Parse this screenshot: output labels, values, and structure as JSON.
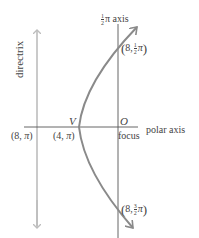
{
  "diagram": {
    "type": "polar parabola",
    "colors": {
      "axis_line": "#555555",
      "directrix_line": "#bdbdbd",
      "curve": "#8a8a8a",
      "text": "#444444",
      "background": "#ffffff"
    },
    "labels": {
      "directrix": "directrix",
      "half_pi_axis_frac_num": "1",
      "half_pi_axis_frac_den": "2",
      "half_pi_axis_suffix": "π axis",
      "polar_axis": "polar axis",
      "vertex": "V",
      "origin": "O",
      "focus": "focus"
    },
    "points": [
      {
        "id": "p8pi",
        "r": "8",
        "theta": "π",
        "text": "(8, π)"
      },
      {
        "id": "p4pi",
        "r": "4",
        "theta": "π",
        "text": "(4, π)"
      },
      {
        "id": "p8half",
        "r": "8",
        "theta_num": "1",
        "theta_den": "2",
        "theta_suffix": "π",
        "text": "(8, ½π)"
      },
      {
        "id": "p8threehalf",
        "r": "8",
        "theta_num": "3",
        "theta_den": "2",
        "theta_suffix": "π",
        "text": "(8, 3/2π)"
      }
    ]
  }
}
